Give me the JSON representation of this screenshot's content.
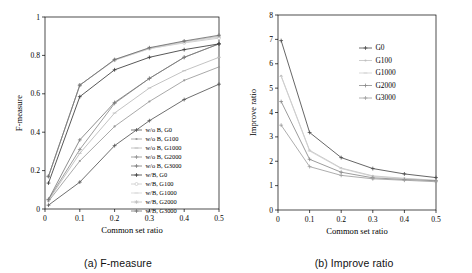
{
  "figure": {
    "panel_a_caption": "(a) F-measure",
    "panel_b_caption": "(b) Improve ratio"
  },
  "chart_data": [
    {
      "type": "line",
      "title": "(a) F-measure",
      "xlabel": "Common set ratio",
      "ylabel": "F-measure",
      "xlim": [
        0,
        0.5
      ],
      "ylim": [
        0,
        1
      ],
      "xticks": [
        0,
        0.1,
        0.2,
        0.3,
        0.4,
        0.5
      ],
      "xtick_labels": [
        "0",
        "0.1",
        "0.2",
        "0.3",
        "0.4",
        "0.5"
      ],
      "yticks": [
        0,
        0.2,
        0.4,
        0.6,
        0.8,
        1
      ],
      "ytick_labels": [
        "0",
        "0.2",
        "0.4",
        "0.6",
        "0.8",
        "1"
      ],
      "grid": false,
      "legend_position": "inside-lower-right",
      "x": [
        0.01,
        0.1,
        0.2,
        0.3,
        0.4,
        0.5
      ],
      "series": [
        {
          "name": "w/o B, G0",
          "color": "#555555",
          "marker": "plus",
          "values": [
            0.02,
            0.14,
            0.33,
            0.46,
            0.57,
            0.65
          ]
        },
        {
          "name": "w/o B, G100",
          "color": "#9a9a9a",
          "marker": "dot",
          "values": [
            0.04,
            0.25,
            0.43,
            0.56,
            0.67,
            0.74
          ]
        },
        {
          "name": "w/o B, G1000",
          "color": "#b8b8b8",
          "marker": "dash",
          "values": [
            0.045,
            0.29,
            0.5,
            0.63,
            0.72,
            0.79
          ]
        },
        {
          "name": "w/o B, G2000",
          "color": "#8d8d8d",
          "marker": "plus",
          "values": [
            0.05,
            0.31,
            0.55,
            0.68,
            0.79,
            0.86
          ]
        },
        {
          "name": "w/o B, G3000",
          "color": "#7a7a7a",
          "marker": "plus",
          "values": [
            0.05,
            0.36,
            0.555,
            0.68,
            0.79,
            0.86
          ]
        },
        {
          "name": "w/B, G0",
          "color": "#3a3a3a",
          "marker": "plus",
          "values": [
            0.135,
            0.585,
            0.725,
            0.79,
            0.83,
            0.86
          ]
        },
        {
          "name": "w/B, G100",
          "color": "#c9c9c9",
          "marker": "circle",
          "values": [
            0.17,
            0.645,
            0.775,
            0.835,
            0.865,
            0.89
          ]
        },
        {
          "name": "w/B, G1000",
          "color": "#d4d4d4",
          "marker": "dash",
          "values": [
            0.17,
            0.645,
            0.775,
            0.835,
            0.868,
            0.895
          ]
        },
        {
          "name": "w/B, G2000",
          "color": "#bcbcbc",
          "marker": "star",
          "values": [
            0.17,
            0.645,
            0.778,
            0.838,
            0.872,
            0.9
          ]
        },
        {
          "name": "w/B, G3000",
          "color": "#6e6e6e",
          "marker": "plus",
          "values": [
            0.17,
            0.645,
            0.778,
            0.84,
            0.875,
            0.905
          ]
        }
      ]
    },
    {
      "type": "line",
      "title": "(b) Improve ratio",
      "xlabel": "Common set ratio",
      "ylabel": "Improve ratio",
      "xlim": [
        0,
        0.5
      ],
      "ylim": [
        0,
        8
      ],
      "xticks": [
        0,
        0.1,
        0.2,
        0.3,
        0.4,
        0.5
      ],
      "xtick_labels": [
        "0",
        "0.1",
        "0.2",
        "0.3",
        "0.4",
        "0.5"
      ],
      "yticks": [
        0,
        1,
        2,
        3,
        4,
        5,
        6,
        7,
        8
      ],
      "ytick_labels": [
        "0",
        "1",
        "2",
        "3",
        "4",
        "5",
        "6",
        "7",
        "8"
      ],
      "grid": false,
      "legend_position": "upper-right",
      "x": [
        0.01,
        0.1,
        0.2,
        0.3,
        0.4,
        0.5
      ],
      "series": [
        {
          "name": "G0",
          "color": "#4a4a4a",
          "marker": "plus",
          "values": [
            6.95,
            3.18,
            2.15,
            1.7,
            1.48,
            1.33
          ]
        },
        {
          "name": "G100",
          "color": "#c0c0c0",
          "marker": "dot",
          "values": [
            5.5,
            2.45,
            1.72,
            1.4,
            1.3,
            1.22
          ]
        },
        {
          "name": "G1000",
          "color": "#cfcfcf",
          "marker": "dash",
          "values": [
            5.48,
            2.42,
            1.7,
            1.38,
            1.28,
            1.21
          ]
        },
        {
          "name": "G2000",
          "color": "#8a8a8a",
          "marker": "plus",
          "values": [
            4.45,
            2.08,
            1.55,
            1.32,
            1.25,
            1.2
          ]
        },
        {
          "name": "G3000",
          "color": "#9e9e9e",
          "marker": "plus",
          "values": [
            3.48,
            1.78,
            1.42,
            1.28,
            1.22,
            1.16
          ]
        }
      ]
    }
  ]
}
